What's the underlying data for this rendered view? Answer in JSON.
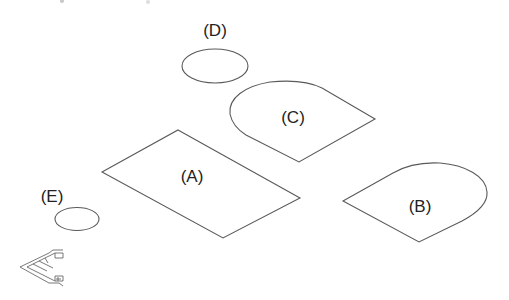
{
  "diagram": {
    "type": "isometric-plane-shapes",
    "background": "#ffffff",
    "stroke_color": "#5a5a5a",
    "shapes": [
      {
        "id": "A",
        "label": "(A)",
        "kind": "parallelogram"
      },
      {
        "id": "B",
        "label": "(B)",
        "kind": "isometric-rounded-tab"
      },
      {
        "id": "C",
        "label": "(C)",
        "kind": "isometric-rounded-tab"
      },
      {
        "id": "D",
        "label": "(D)",
        "kind": "ellipse"
      },
      {
        "id": "E",
        "label": "(E)",
        "kind": "ellipse"
      }
    ],
    "axis_icon": {
      "name": "isometric-axis-indicator"
    }
  }
}
